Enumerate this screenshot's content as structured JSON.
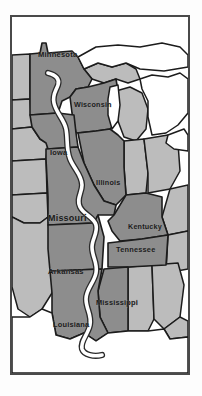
{
  "figure": {
    "kind": "reference-map"
  },
  "colors": {
    "page_background": "#fdfdfd",
    "frame_border": "#4a4a4a",
    "highlight_state_fill": "#8d8d8d",
    "other_state_fill": "#bcbcbc",
    "water_fill": "#ffffff",
    "border_stroke": "#1c1c1c",
    "river_fill": "#ffffff",
    "river_outline": "#2a2a2a",
    "label_text": "#1b1b1b"
  },
  "legend_note": "",
  "river": {
    "name": "Mississippi River",
    "style": "white-line-with-dark-outline",
    "source_region": "Minnesota",
    "mouth_region": "Gulf of Mexico delta"
  },
  "labels": [
    {
      "id": "minnesota",
      "name": "Minnesota",
      "x": 26,
      "y": 40,
      "size": 7.6,
      "highlight": true
    },
    {
      "id": "wisconsin",
      "name": "Wisconsin",
      "x": 62,
      "y": 90,
      "size": 7.2,
      "highlight": true
    },
    {
      "id": "iowa",
      "name": "Iowa",
      "x": 38,
      "y": 138,
      "size": 7.4,
      "highlight": true
    },
    {
      "id": "illinois",
      "name": "Illinois",
      "x": 84,
      "y": 168,
      "size": 7.2,
      "highlight": true
    },
    {
      "id": "missouri",
      "name": "Missouri",
      "x": 36,
      "y": 204,
      "size": 9.0,
      "highlight": true
    },
    {
      "id": "kentucky",
      "name": "Kentucky",
      "x": 116,
      "y": 212,
      "size": 7.2,
      "highlight": true
    },
    {
      "id": "tennessee",
      "name": "Tennessee",
      "x": 104,
      "y": 235,
      "size": 7.4,
      "highlight": true
    },
    {
      "id": "arkansas",
      "name": "Arkansas",
      "x": 36,
      "y": 257,
      "size": 7.6,
      "highlight": true
    },
    {
      "id": "mississippi",
      "name": "Mississippi",
      "x": 84,
      "y": 288,
      "size": 7.4,
      "highlight": true
    },
    {
      "id": "louisiana",
      "name": "Louisiana",
      "x": 41,
      "y": 310,
      "size": 7.4,
      "highlight": true
    }
  ],
  "highlighted_states": [
    "Minnesota",
    "Wisconsin",
    "Iowa",
    "Illinois",
    "Missouri",
    "Kentucky",
    "Tennessee",
    "Arkansas",
    "Mississippi",
    "Louisiana"
  ],
  "water_bodies": [
    "Lake Superior",
    "Lake Michigan",
    "Lake Huron",
    "Lake Erie",
    "Gulf of Mexico"
  ]
}
